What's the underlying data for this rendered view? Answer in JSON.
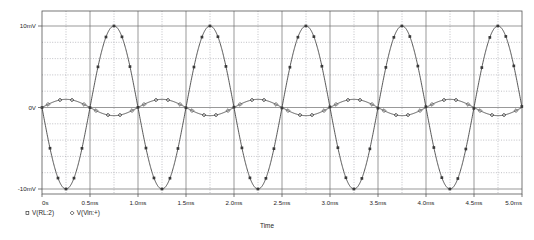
{
  "chart_data": {
    "type": "line",
    "title": "",
    "subtitle": "",
    "xlabel": "Time",
    "ylabel": "",
    "xlim": [
      0,
      5.0
    ],
    "ylim": [
      -10,
      10
    ],
    "x_unit": "ms",
    "y_unit": "mV",
    "grid": true,
    "legend_position": "bottom-left",
    "x_tick_labels": [
      "0s",
      "0.5ms",
      "1.0ms",
      "1.5ms",
      "2.0ms",
      "2.5ms",
      "3.0ms",
      "3.5ms",
      "4.0ms",
      "4.5ms",
      "5.0ms"
    ],
    "x_tick_values": [
      0,
      0.5,
      1.0,
      1.5,
      2.0,
      2.5,
      3.0,
      3.5,
      4.0,
      4.5,
      5.0
    ],
    "y_tick_labels": [
      "10mV",
      "0V",
      "-10mV"
    ],
    "y_tick_values": [
      10,
      0,
      -10
    ],
    "y_minor_step": 2,
    "series": [
      {
        "name": "V(RL:2)",
        "marker": "square",
        "amplitude_mv": 10.0,
        "frequency_khz": 1.0,
        "phase_deg": 180,
        "offset_mv": 0.0,
        "color": "#3a3a3a"
      },
      {
        "name": "V(Vin:+)",
        "marker": "diamond",
        "amplitude_mv": 1.0,
        "frequency_khz": 1.0,
        "phase_deg": 0,
        "offset_mv": 0.0,
        "color": "#3a3a3a"
      }
    ]
  },
  "legend": {
    "entries": [
      {
        "symbol": "square",
        "label": "V(RL:2)"
      },
      {
        "symbol": "diamond",
        "label": "V(Vin:+)"
      }
    ]
  },
  "axis": {
    "x_title": "Time"
  }
}
